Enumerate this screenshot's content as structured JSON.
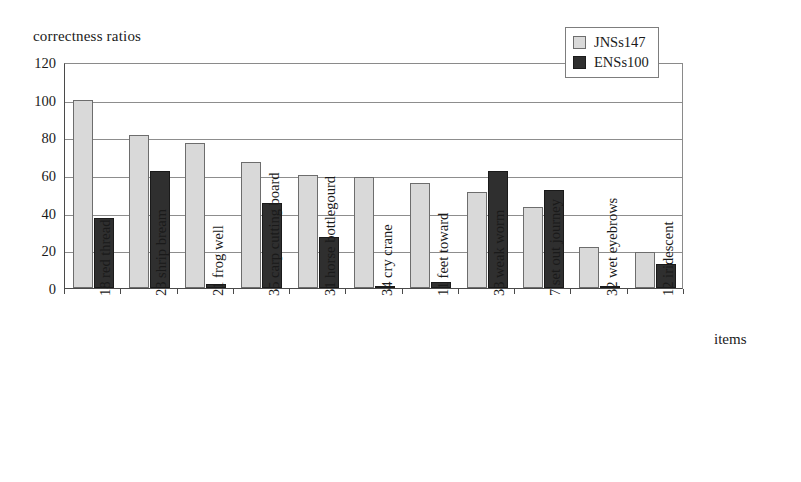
{
  "chart_data": {
    "type": "bar",
    "title": "correctness ratios",
    "xlabel": "items",
    "ylabel": "correctness ratios",
    "ylim": [
      0,
      120
    ],
    "yticks": [
      0,
      20,
      40,
      60,
      80,
      100,
      120
    ],
    "grid": true,
    "legend_position": "top-right",
    "categories": [
      "18 red thread",
      "23 shrip bream",
      "21 frog well",
      "35 carp cutting board",
      "31 horse bottlegourd",
      "34 cry crane",
      "11 feet toward",
      "33 weak worm",
      "7 set out journey",
      "32 wet eyebrows",
      "12 iridescent"
    ],
    "series": [
      {
        "name": "JNSs147",
        "color": "#d9d9d9",
        "values": [
          100,
          81,
          77,
          67,
          60,
          59,
          56,
          51,
          43,
          22,
          19
        ]
      },
      {
        "name": "ENSs100",
        "color": "#2f2f2f",
        "values": [
          37,
          62,
          2,
          45,
          27,
          1,
          3,
          62,
          52,
          1,
          13
        ]
      }
    ]
  },
  "legend": {
    "entries": [
      {
        "label": "JNSs147"
      },
      {
        "label": "ENSs100"
      }
    ]
  }
}
